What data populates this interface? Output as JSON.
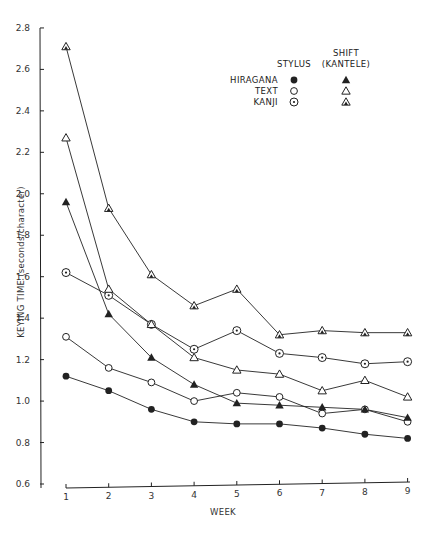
{
  "chart_data": {
    "type": "line",
    "title": "",
    "xlabel": "WEEK",
    "ylabel": "KEYING TIME (seconds/character)",
    "x": [
      1,
      2,
      3,
      4,
      5,
      6,
      7,
      8,
      9
    ],
    "xticks": [
      "1",
      "2",
      "3",
      "4",
      "5",
      "6",
      "7",
      "8",
      "9"
    ],
    "yticks": [
      "0.6",
      "0.8",
      "1.0",
      "1.2",
      "1.4",
      "1.6",
      "1.8",
      "2.0",
      "2.2",
      "2.4",
      "2.6",
      "2.8"
    ],
    "ylim": [
      0.6,
      2.8
    ],
    "xlim": [
      1,
      9
    ],
    "grid": false,
    "legend": {
      "position": "top-right",
      "column_headers": [
        "STYLUS",
        "SHIFT (KANTELE)"
      ],
      "row_labels": [
        "HIRAGANA",
        "TEXT",
        "KANJI"
      ]
    },
    "series": [
      {
        "name": "Hiragana - Stylus",
        "marker": "filled-circle",
        "values": [
          1.12,
          1.05,
          0.96,
          0.9,
          0.89,
          0.89,
          0.87,
          0.84,
          0.82
        ]
      },
      {
        "name": "Text - Stylus",
        "marker": "open-circle",
        "values": [
          1.31,
          1.16,
          1.09,
          1.0,
          1.04,
          1.02,
          0.94,
          0.96,
          0.9
        ]
      },
      {
        "name": "Kanji - Stylus",
        "marker": "dotted-circle",
        "values": [
          1.62,
          1.51,
          1.37,
          1.25,
          1.34,
          1.23,
          1.21,
          1.18,
          1.19
        ]
      },
      {
        "name": "Hiragana - Shift (Kantele)",
        "marker": "filled-triangle",
        "values": [
          1.96,
          1.42,
          1.21,
          1.08,
          0.99,
          0.98,
          0.97,
          0.96,
          0.92
        ]
      },
      {
        "name": "Text - Shift (Kantele)",
        "marker": "open-triangle",
        "values": [
          2.27,
          1.54,
          1.37,
          1.21,
          1.15,
          1.13,
          1.05,
          1.1,
          1.02
        ]
      },
      {
        "name": "Kanji - Shift (Kantele)",
        "marker": "dotted-triangle",
        "values": [
          2.71,
          1.93,
          1.61,
          1.46,
          1.54,
          1.32,
          1.34,
          1.33,
          1.33
        ]
      }
    ]
  },
  "labels": {
    "xlabel": "WEEK",
    "ylabel": "KEYING TIME (seconds/character)",
    "legend_col_stylus": "STYLUS",
    "legend_col_shift_1": "SHIFT",
    "legend_col_shift_2": "(KANTELE)",
    "legend_row_hiragana": "HIRAGANA",
    "legend_row_text": "TEXT",
    "legend_row_kanji": "KANJI"
  },
  "colors": {
    "ink": "#222222",
    "background": "#ffffff"
  }
}
